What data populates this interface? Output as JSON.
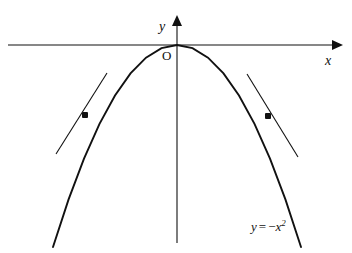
{
  "figure": {
    "background_color": "#ffffff",
    "ink_color": "#111111",
    "width": 352,
    "height": 253
  },
  "labels": {
    "y_axis": "y",
    "x_axis": "x",
    "origin": "O",
    "equation_lhs": "y",
    "equation_equals": "=",
    "equation_minus": "−",
    "equation_variable": "x",
    "equation_exponent": "2",
    "equation_full": "y = −x²"
  },
  "chart_data": {
    "type": "line",
    "title": "",
    "subtitle": "",
    "xlabel": "x",
    "ylabel": "y",
    "grid": false,
    "legend": "none",
    "annotations": [
      {
        "name": "curve-equation",
        "text": "y = −x²",
        "x_px": 251,
        "y_px": 220
      },
      {
        "name": "origin-label",
        "text": "O",
        "x_px": 162,
        "y_px": 49
      }
    ],
    "axes": {
      "origin_px": {
        "x": 177,
        "y": 45
      },
      "x_axis": {
        "x_start_px": 8,
        "x_end_px": 338,
        "y_px": 45,
        "arrow": "right",
        "label": "x"
      },
      "y_axis": {
        "x_px": 177,
        "y_start_px": 18,
        "y_end_px": 243,
        "arrow": "up",
        "label": "y"
      },
      "xlim": [
        -2.1,
        2.75
      ],
      "ylim": [
        -4.4,
        0.45
      ]
    },
    "series": [
      {
        "name": "y = -x^2",
        "equation": "y = -x^2",
        "type": "parabola",
        "opens": "down",
        "vertex": {
          "x": 0,
          "y": 0
        },
        "coefficient": -1,
        "x": [
          -2.0,
          -1.75,
          -1.5,
          -1.25,
          -1.0,
          -0.75,
          -0.5,
          -0.25,
          0,
          0.25,
          0.5,
          0.75,
          1.0,
          1.25,
          1.5,
          1.75,
          2.0
        ],
        "values": [
          -4.0,
          -3.0625,
          -2.25,
          -1.5625,
          -1.0,
          -0.5625,
          -0.25,
          -0.0625,
          0,
          -0.0625,
          -0.25,
          -0.5625,
          -1.0,
          -1.5625,
          -2.25,
          -3.0625,
          -4.0
        ]
      }
    ],
    "tangent_lines": [
      {
        "name": "left-tangent",
        "point_of_tangency": {
          "x": -1.5,
          "y": -2.25
        },
        "point_px": {
          "x": 85,
          "y": 115
        },
        "slope": 3.0,
        "segment_px": {
          "x1": 56,
          "y1": 154,
          "x2": 107,
          "y2": 73
        }
      },
      {
        "name": "right-tangent",
        "point_of_tangency": {
          "x": 1.5,
          "y": -2.25
        },
        "point_px": {
          "x": 268,
          "y": 116
        },
        "slope": -3.0,
        "segment_px": {
          "x1": 247,
          "y1": 74,
          "x2": 298,
          "y2": 157
        }
      }
    ],
    "markers": [
      {
        "name": "left-tangency-point",
        "x_px": 85,
        "y_px": 115,
        "style": "filled-square-dot"
      },
      {
        "name": "right-tangency-point",
        "x_px": 268,
        "y_px": 116,
        "style": "filled-square-dot"
      }
    ]
  }
}
